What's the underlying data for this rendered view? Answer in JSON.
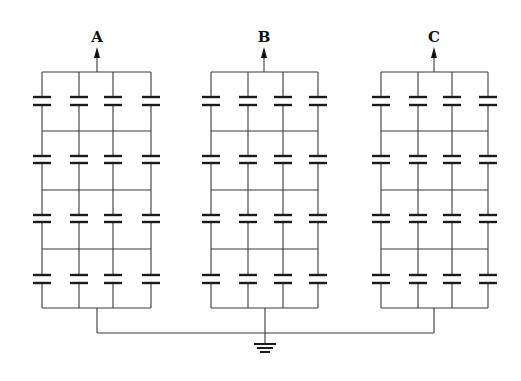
{
  "diagram": {
    "type": "capacitor-bank-circuit",
    "phases": [
      {
        "label": "A",
        "x_cols": [
          42,
          79,
          113,
          151
        ],
        "arrow_x": 97
      },
      {
        "label": "B",
        "x_cols": [
          211,
          248,
          283,
          318
        ],
        "arrow_x": 264
      },
      {
        "label": "C",
        "x_cols": [
          381,
          418,
          452,
          488
        ],
        "arrow_x": 434
      }
    ],
    "rows": 4,
    "cols_per_bank": 4,
    "row_bars_y": [
      72,
      131,
      190,
      249,
      308
    ],
    "capacitor_plate_y": [
      [
        97,
        105
      ],
      [
        156,
        163
      ],
      [
        215,
        222
      ],
      [
        275,
        283
      ]
    ],
    "ground_bus_y": 333,
    "ground_x": 265,
    "colors": {
      "wire": "#3a3a3a",
      "plate": "#1a1a1a",
      "background": "#ffffff"
    },
    "symbols": [
      "capacitor",
      "arrow-up",
      "ground"
    ]
  }
}
